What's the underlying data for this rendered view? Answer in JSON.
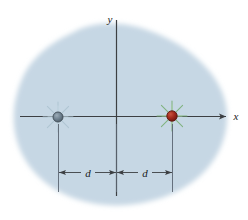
{
  "figure": {
    "type": "physics-diagram",
    "background_color": "#ffffff",
    "region": {
      "name": "shaded-region",
      "fill_color": "#c6d7e4",
      "edge_softness": "blurred"
    },
    "axes": {
      "color": "#3c3f42",
      "x_axis": {
        "label": "x",
        "label_x": 233,
        "label_y": 119,
        "arrow": true,
        "y_position": 116,
        "x_start": 20,
        "x_end": 226
      },
      "y_axis": {
        "label": "y",
        "label_x": 110,
        "label_y": 23,
        "arrow": false,
        "x_position": 116,
        "y_start": 20,
        "y_end": 196
      },
      "origin": {
        "x": 116,
        "y": 116
      }
    },
    "charges": [
      {
        "name": "left-charge",
        "cx": 58,
        "cy": 117,
        "radius": 5,
        "fill_color": "#6e808e",
        "stroke_color": "#3f4c56",
        "burst_color": "#b9cbd6",
        "burst_rays": 8,
        "burst_radius": 15
      },
      {
        "name": "right-charge",
        "cx": 172,
        "cy": 116,
        "radius": 5,
        "fill_color": "#a32a1c",
        "stroke_color": "#5d1710",
        "burst_color": "#8fbf8a",
        "burst_rays": 8,
        "burst_radius": 15
      }
    ],
    "dimensions": [
      {
        "name": "dimension-left",
        "label": "d",
        "label_x": 87,
        "label_y": 176,
        "line_y": 172,
        "x_from": 58,
        "x_to": 116
      },
      {
        "name": "dimension-right",
        "label": "d",
        "label_x": 144,
        "label_y": 176,
        "line_y": 172,
        "x_from": 116,
        "x_to": 172
      }
    ],
    "extension_lines": [
      {
        "name": "extension-line-left",
        "x": 58,
        "y_from": 122,
        "y_to": 192
      },
      {
        "name": "extension-line-center",
        "x": 116,
        "y_from": 122,
        "y_to": 192
      },
      {
        "name": "extension-line-right",
        "x": 172,
        "y_from": 122,
        "y_to": 192
      }
    ]
  }
}
